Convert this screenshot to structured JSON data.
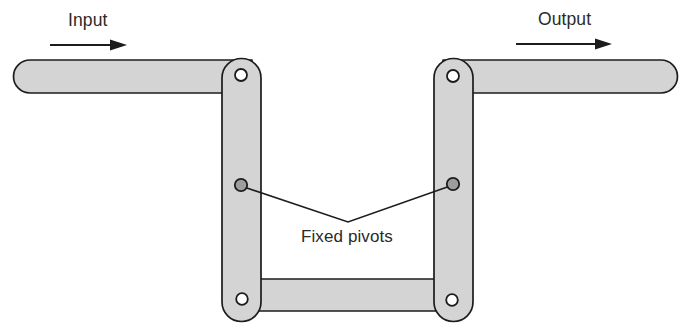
{
  "diagram": {
    "type": "mechanical-linkage-schematic",
    "labels": {
      "input": "Input",
      "output": "Output",
      "fixed_pivots": "Fixed pivots"
    },
    "colors": {
      "link_fill": "#d4d4d4",
      "link_outline": "#1c1c1c",
      "pivot_hole_fill": "#ffffff",
      "fixed_pivot_fill": "#9d9d9d",
      "background": "#ffffff",
      "text": "#2a2a2a"
    },
    "links": [
      {
        "name": "input-link",
        "orientation": "horizontal",
        "x": 13,
        "y": 60,
        "width": 232,
        "height": 33,
        "cap": "rounded-left"
      },
      {
        "name": "left-rocker-link",
        "orientation": "vertical",
        "x": 222,
        "y": 59,
        "width": 39,
        "height": 262,
        "cap": "rounded-both"
      },
      {
        "name": "right-rocker-link",
        "orientation": "vertical",
        "x": 434,
        "y": 59,
        "width": 39,
        "height": 262,
        "cap": "rounded-both"
      },
      {
        "name": "output-link",
        "orientation": "horizontal",
        "x": 450,
        "y": 60,
        "width": 228,
        "height": 33,
        "cap": "rounded-right"
      },
      {
        "name": "coupler-link",
        "orientation": "horizontal",
        "x": 240,
        "y": 279,
        "width": 216,
        "height": 32,
        "cap": "square"
      }
    ],
    "pivots": [
      {
        "name": "pin-joint-top-left",
        "cx": 241,
        "cy": 75,
        "r": 6.0,
        "kind": "hole"
      },
      {
        "name": "pin-joint-top-right",
        "cx": 453,
        "cy": 76,
        "r": 6.0,
        "kind": "hole"
      },
      {
        "name": "pin-joint-bottom-left",
        "cx": 242,
        "cy": 299,
        "r": 5.8,
        "kind": "hole"
      },
      {
        "name": "pin-joint-bottom-right",
        "cx": 452,
        "cy": 300,
        "r": 5.8,
        "kind": "hole"
      },
      {
        "name": "fixed-pivot-left",
        "cx": 241,
        "cy": 185,
        "r": 6.2,
        "kind": "fixed"
      },
      {
        "name": "fixed-pivot-right",
        "cx": 453,
        "cy": 184,
        "r": 6.2,
        "kind": "fixed"
      }
    ],
    "leader": {
      "name": "fixed-pivots-leader",
      "points": "241,186 348,222 453,185",
      "apex_x": 348,
      "apex_y": 222
    },
    "arrows": [
      {
        "name": "input-flow-arrow",
        "x1": 50,
        "x2": 120,
        "y": 45,
        "head": "126,45 112,40 112,50",
        "direction": "right"
      },
      {
        "name": "output-flow-arrow",
        "x1": 516,
        "x2": 604,
        "y": 44,
        "head": "612,44 598,39 598,49",
        "direction": "right"
      }
    ]
  }
}
